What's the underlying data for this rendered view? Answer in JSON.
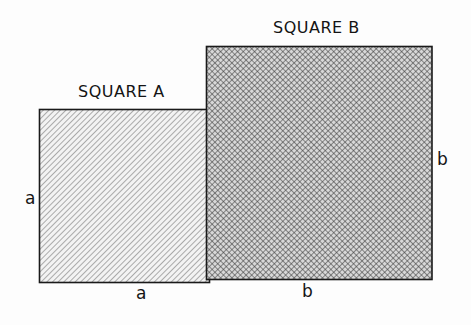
{
  "diagram": {
    "squares": [
      {
        "id": "A",
        "title": "SQUARE A",
        "side_label": "a",
        "pattern": "diagonal-hatch",
        "x": 39,
        "y": 109,
        "width": 170,
        "height": 173
      },
      {
        "id": "B",
        "title": "SQUARE B",
        "side_label": "b",
        "pattern": "cross-hatch",
        "x": 207,
        "y": 46,
        "width": 225,
        "height": 233
      }
    ],
    "labels": {
      "square_a_title": "SQUARE A",
      "square_b_title": "SQUARE B",
      "a_left": "a",
      "a_bottom": "a",
      "b_bottom": "b",
      "b_right": "b"
    },
    "colors": {
      "stroke": "#1a1a1a",
      "hatch_a": "#8a8a8a",
      "hatch_b": "#2a2a2a",
      "background": "#fdfdfd"
    }
  }
}
